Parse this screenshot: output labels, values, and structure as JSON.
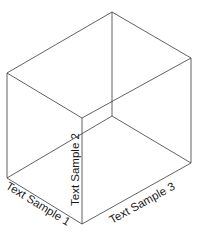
{
  "diagram": {
    "type": "3d-box-axes",
    "colors": {
      "edge": "#3a3a3a",
      "text": "#1a1a1a",
      "background": "#ffffff"
    },
    "vertices": {
      "top_back": [
        112,
        12
      ],
      "top_left": [
        7,
        73
      ],
      "top_right": [
        191,
        58
      ],
      "top_front": [
        82,
        118
      ],
      "bottom_back": [
        112,
        116
      ],
      "bottom_left": [
        7,
        178
      ],
      "bottom_right": [
        191,
        163
      ],
      "bottom_front": [
        82,
        224
      ]
    },
    "labels": {
      "axis1": "Text Sample 1",
      "axis2": "Text Sample 2",
      "axis3": "Text Sample 3"
    }
  }
}
